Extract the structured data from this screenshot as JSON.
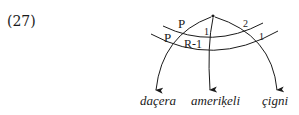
{
  "example_number": "(27)",
  "diagram": {
    "node_marker": "•",
    "arc_labels": {
      "upper_left": "P",
      "upper_right": "2",
      "upper_middle": "1",
      "lower_left": "P",
      "lower_middle": "R-1",
      "lower_right": "1"
    },
    "words": [
      "daçera",
      "ameriḳeli",
      "çigni"
    ]
  }
}
